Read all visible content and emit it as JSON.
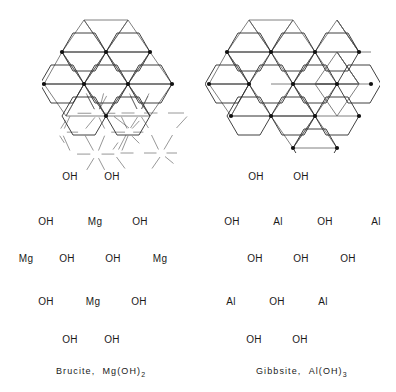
{
  "figure": {
    "kind": "crystal-structure-comparison"
  },
  "panels": [
    {
      "id": "brucite",
      "caption_name": "Brucite,",
      "caption_formula_base": "Mg(OH)",
      "caption_formula_sub": "2",
      "sheet_type": "trioctahedral",
      "cation": "Mg",
      "ligand": "OH",
      "atoms": [
        {
          "label": "OH",
          "x": 70,
          "y": 177
        },
        {
          "label": "OH",
          "x": 112,
          "y": 177
        },
        {
          "label": "OH",
          "x": 46,
          "y": 222
        },
        {
          "label": "Mg",
          "x": 95,
          "y": 222
        },
        {
          "label": "OH",
          "x": 140,
          "y": 222
        },
        {
          "label": "Mg",
          "x": 26,
          "y": 259
        },
        {
          "label": "OH",
          "x": 67,
          "y": 259
        },
        {
          "label": "OH",
          "x": 113,
          "y": 259
        },
        {
          "label": "Mg",
          "x": 160,
          "y": 259
        },
        {
          "label": "OH",
          "x": 46,
          "y": 302
        },
        {
          "label": "Mg",
          "x": 93,
          "y": 302
        },
        {
          "label": "OH",
          "x": 139,
          "y": 302
        },
        {
          "label": "OH",
          "x": 70,
          "y": 340
        },
        {
          "label": "OH",
          "x": 112,
          "y": 340
        }
      ]
    },
    {
      "id": "gibbsite",
      "caption_name": "Gibbsite,",
      "caption_formula_base": "Al(OH)",
      "caption_formula_sub": "3",
      "sheet_type": "dioctahedral",
      "cation": "Al",
      "ligand": "OH",
      "atoms": [
        {
          "label": "OH",
          "x": 256,
          "y": 177
        },
        {
          "label": "OH",
          "x": 301,
          "y": 177
        },
        {
          "label": "OH",
          "x": 232,
          "y": 222
        },
        {
          "label": "Al",
          "x": 278,
          "y": 222
        },
        {
          "label": "OH",
          "x": 325,
          "y": 222
        },
        {
          "label": "Al",
          "x": 376,
          "y": 222
        },
        {
          "label": "OH",
          "x": 255,
          "y": 259
        },
        {
          "label": "OH",
          "x": 301,
          "y": 259
        },
        {
          "label": "OH",
          "x": 348,
          "y": 259
        },
        {
          "label": "Al",
          "x": 231,
          "y": 302
        },
        {
          "label": "OH",
          "x": 277,
          "y": 302
        },
        {
          "label": "Al",
          "x": 323,
          "y": 302
        },
        {
          "label": "OH",
          "x": 254,
          "y": 340
        },
        {
          "label": "OH",
          "x": 300,
          "y": 340
        }
      ]
    }
  ],
  "colors": {
    "bond": "#3a3a3a",
    "polyhedron_edge": "#2b2b2b",
    "polyhedron_inner": "#555555",
    "text": "#1a1a1a",
    "background": "#ffffff"
  }
}
